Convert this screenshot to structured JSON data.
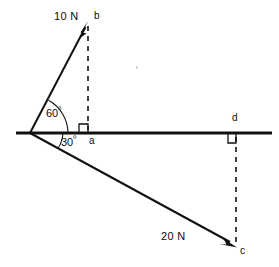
{
  "diagram": {
    "background_color": "#ffffff",
    "ink_color": "#111111",
    "origin_label": "0",
    "labels": {
      "force_b": "10 N",
      "force_c": "20 N",
      "point_b": "b",
      "point_a": "a",
      "point_c": "c",
      "point_d": "d",
      "angle_upper": "60",
      "angle_lower": "30",
      "degree_symbol": "º"
    },
    "geometry": {
      "origin": {
        "x": 30,
        "y": 133
      },
      "axis_start": {
        "x": 16,
        "y": 133
      },
      "axis_end": {
        "x": 272,
        "y": 133
      },
      "point_b": {
        "x": 88,
        "y": 22
      },
      "point_a": {
        "x": 88,
        "y": 133
      },
      "point_c": {
        "x": 236,
        "y": 247
      },
      "point_d": {
        "x": 236,
        "y": 133
      }
    },
    "vectors": [
      {
        "name": "vector-b",
        "magnitude": "10 N",
        "angle_above_horizontal_deg": 60,
        "tip_point": "b",
        "component_foot": "a"
      },
      {
        "name": "vector-c",
        "magnitude": "20 N",
        "angle_below_horizontal_deg": 30,
        "tip_point": "c",
        "component_foot": "d"
      }
    ]
  }
}
